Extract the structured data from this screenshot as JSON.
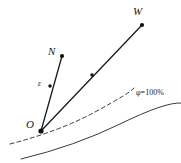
{
  "figure": {
    "type": "line-diagram",
    "background_color": "#ffffff",
    "stroke_color": "#1a1a1a",
    "curve_color": "#333333",
    "width": 181,
    "height": 163
  },
  "labels": {
    "origin": "O",
    "ray_n": "N",
    "ray_w": "W",
    "epsilon": "ε",
    "saturation": "φ=100%"
  },
  "points": {
    "origin": {
      "x": 41,
      "y": 131
    },
    "n_end": {
      "x": 62,
      "y": 56
    },
    "w_end": {
      "x": 142,
      "y": 25
    },
    "marker_on_on": {
      "x": 50,
      "y": 86
    },
    "marker_on_ow": {
      "x": 92,
      "y": 75
    }
  },
  "curves": {
    "dashed": {
      "style": "dashed",
      "start": {
        "x": 10,
        "y": 144
      },
      "end": {
        "x": 134,
        "y": 88
      }
    },
    "solid": {
      "style": "solid",
      "start": {
        "x": 21,
        "y": 159
      },
      "end": {
        "x": 181,
        "y": 103
      }
    }
  }
}
